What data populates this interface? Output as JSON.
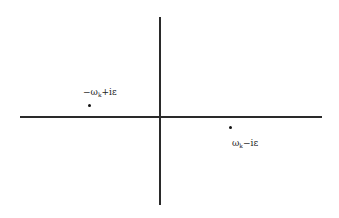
{
  "diagram": {
    "axes": {
      "horizontal": {
        "x_start": 20,
        "x_end": 322,
        "y": 117
      },
      "vertical": {
        "x": 160,
        "y_start": 17,
        "y_end": 205
      }
    },
    "poles": [
      {
        "id": "upper-left",
        "label_prefix": "−ω",
        "label_sub": "k",
        "label_suffix": "+iε",
        "position": {
          "x": 90,
          "y": 106
        }
      },
      {
        "id": "lower-right",
        "label_prefix": "ω",
        "label_sub": "k",
        "label_suffix": "−iε",
        "position": {
          "x": 230,
          "y": 128
        }
      }
    ],
    "colors": {
      "background": "#ffffff",
      "axis": "#2a2a2a",
      "pole": "#111111",
      "label": "#222222"
    }
  }
}
